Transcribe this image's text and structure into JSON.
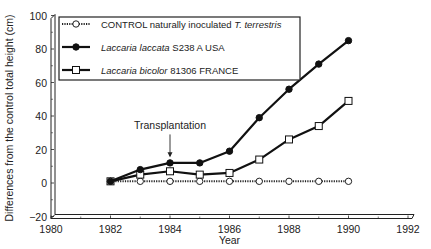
{
  "chart_data": {
    "type": "line",
    "title": "",
    "xlabel": "Year",
    "ylabel": "Differences from the control total height (cm)",
    "xlim": [
      1980,
      1992
    ],
    "ylim": [
      -20,
      100
    ],
    "x_ticks": [
      1980,
      1982,
      1984,
      1986,
      1988,
      1990,
      1992
    ],
    "y_ticks": [
      -20,
      0,
      20,
      40,
      60,
      80,
      100
    ],
    "x_tick_labels": [
      "1980",
      "1982",
      "1984",
      "1986",
      "1988",
      "1990",
      "1992"
    ],
    "y_tick_labels": [
      "−20",
      "0",
      "20",
      "40",
      "60",
      "80",
      "100"
    ],
    "grid": false,
    "legend_position": "upper left (boxed)",
    "x": [
      1982,
      1983,
      1984,
      1985,
      1986,
      1987,
      1988,
      1989,
      1990
    ],
    "series": [
      {
        "name": "CONTROL naturally inoculated T. terrestris",
        "legend_plain": "CONTROL naturally inoculated ",
        "legend_italic": "T. terrestris",
        "marker": "open-circle",
        "line_style": "dotted",
        "color": "#222222",
        "x": [
          1982,
          1983,
          1984,
          1985,
          1986,
          1987,
          1988,
          1989,
          1990
        ],
        "values": [
          1,
          1,
          1,
          1,
          1,
          1,
          1,
          1,
          1
        ]
      },
      {
        "name": "Laccaria laccata S238 A USA",
        "legend_italic": "Laccaria laccata",
        "legend_plain": " S238 A USA",
        "marker": "filled-circle",
        "line_style": "solid",
        "color": "#111111",
        "x": [
          1982,
          1983,
          1984,
          1985,
          1986,
          1987,
          1988,
          1989,
          1990
        ],
        "values": [
          1,
          8,
          12,
          12,
          19,
          39,
          56,
          71,
          85
        ]
      },
      {
        "name": "Laccaria bicolor 81306 FRANCE",
        "legend_italic": "Laccaria bicolor",
        "legend_plain": " 81306 FRANCE",
        "marker": "open-square",
        "line_style": "solid",
        "color": "#111111",
        "x": [
          1982,
          1983,
          1984,
          1985,
          1986,
          1987,
          1988,
          1989,
          1990
        ],
        "values": [
          1,
          5,
          7,
          5,
          6,
          14,
          26,
          34,
          49
        ]
      }
    ],
    "annotations": [
      {
        "text": "Transplantation",
        "x": 1984,
        "arrow_to_y": 16
      }
    ]
  }
}
